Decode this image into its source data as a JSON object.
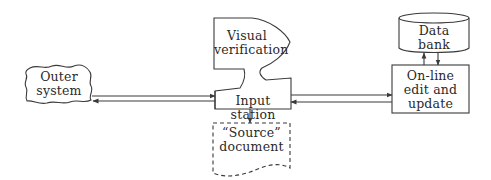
{
  "diagram": {
    "nodes": {
      "outer_system": {
        "lines": [
          "Outer",
          "system"
        ],
        "shape": "cloud"
      },
      "visual_verification": {
        "lines": [
          "Visual",
          "verification"
        ],
        "shape": "display"
      },
      "input_station": {
        "label": "Input station",
        "shape": "trapezoid-box"
      },
      "source_document": {
        "lines": [
          "“Source”",
          "document"
        ],
        "shape": "document-dashed"
      },
      "data_bank": {
        "lines": [
          "Data",
          "bank"
        ],
        "shape": "cylinder"
      },
      "online_edit": {
        "lines": [
          "On-line",
          "edit and",
          "update"
        ],
        "shape": "rectangle"
      }
    },
    "edges": [
      {
        "from": "outer_system",
        "to": "input_station"
      },
      {
        "from": "input_station",
        "to": "outer_system"
      },
      {
        "from": "input_station",
        "to": "online_edit"
      },
      {
        "from": "online_edit",
        "to": "input_station"
      },
      {
        "from": "input_station",
        "to": "source_document"
      },
      {
        "from": "online_edit",
        "to": "data_bank"
      },
      {
        "from": "data_bank",
        "to": "online_edit"
      }
    ],
    "stroke_color": "#3a3a3a"
  }
}
